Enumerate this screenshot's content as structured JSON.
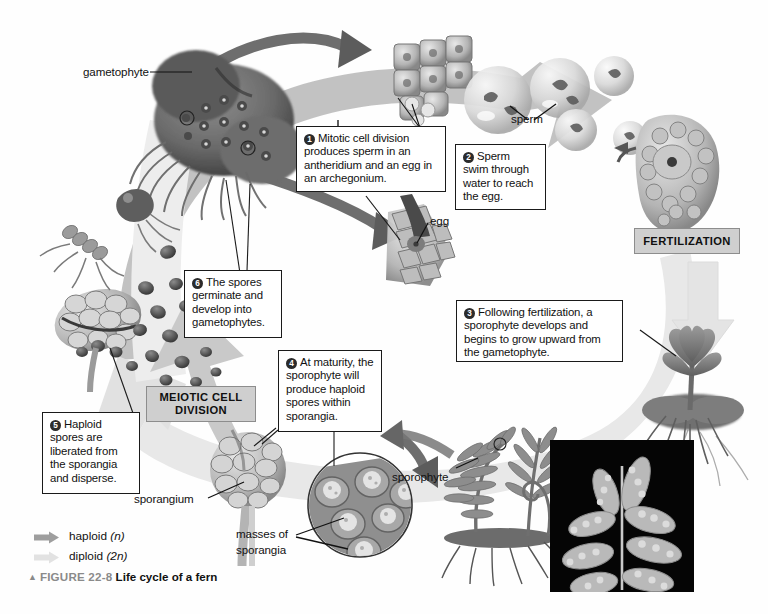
{
  "figure": {
    "marker": "▲",
    "number": "FIGURE 22-8",
    "title": "Life cycle of a fern"
  },
  "legend": {
    "items": [
      {
        "label": "haploid ",
        "italic": "(n)",
        "color": "#9e9e9e",
        "name": "haploid"
      },
      {
        "label": "diploid ",
        "italic": "(2n)",
        "color": "#e2e2e2",
        "name": "diploid"
      }
    ]
  },
  "process_labels": [
    {
      "id": "fertilization",
      "text": "FERTILIZATION"
    },
    {
      "id": "meiosis",
      "line1": "MEIOTIC CELL",
      "line2": "DIVISION"
    }
  ],
  "callouts": [
    {
      "num": "1",
      "text": "Mitotic cell division produces sperm in an antheridium and an egg in an archegonium."
    },
    {
      "num": "2",
      "text": "Sperm swim through water to reach the egg."
    },
    {
      "num": "3",
      "text": "Following fertilization, a sporophyte develops and begins to grow upward from the gametophyte."
    },
    {
      "num": "4",
      "text": "At maturity, the sporophyte will produce haploid spores within sporangia."
    },
    {
      "num": "5",
      "text": "Haploid spores are liberated from the sporangia and disperse."
    },
    {
      "num": "6",
      "text": "The spores germinate and develop into gametophytes."
    }
  ],
  "structure_labels": [
    {
      "id": "gametophyte",
      "text": "gametophyte"
    },
    {
      "id": "sperm",
      "text": "sperm"
    },
    {
      "id": "egg",
      "text": "egg"
    },
    {
      "id": "sporophyte",
      "text": "sporophyte"
    },
    {
      "id": "sporangium",
      "text": "sporangium"
    },
    {
      "id": "masses-of-sporangia-l1",
      "text": "masses of"
    },
    {
      "id": "masses-of-sporangia-l2",
      "text": "sporangia"
    }
  ],
  "colors": {
    "haploid_arrow": "#9e9e9e",
    "diploid_arrow": "#e2e2e2",
    "process_box": "#cfcfcf",
    "callout_border": "#1a1a1a",
    "background": "#fefefe",
    "photo_bg": "#050505"
  }
}
